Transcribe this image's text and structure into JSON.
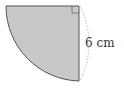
{
  "diagram": {
    "shape": "quarter-circle",
    "fill_color": "#c8c8c8",
    "stroke_color": "#555555",
    "radius_label": "6 cm",
    "right_angle_marker": true,
    "dimension_arc": "dotted"
  }
}
